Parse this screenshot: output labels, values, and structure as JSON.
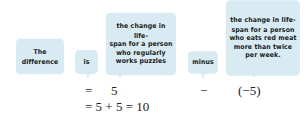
{
  "labels": {
    "difference": "The\ndifference",
    "is": "is",
    "puzzles": "the change in life-\nspan for a person\nwho regularly\nworks puzzles",
    "minus": "minus",
    "red_meat": "the change in life-\nspan for a person\nwho eats red meat\nmore than twice\nper week."
  },
  "equation": {
    "row1": {
      "equals": "=",
      "first_value": "5",
      "operator": "−",
      "second_value": "(−5)"
    },
    "row2": {
      "text": "= 5 + 5 = 10"
    }
  },
  "colors": {
    "box_fill": "#d8ebf3",
    "text": "#1a1a1a"
  }
}
